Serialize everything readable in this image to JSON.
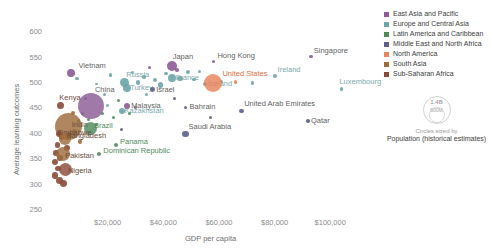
{
  "chart_data": {
    "type": "scatter",
    "title": "",
    "xlabel": "GDP per capita",
    "ylabel": "Average learning outcomes",
    "xlim": [
      0,
      115000
    ],
    "ylim": [
      250,
      620
    ],
    "xticks": [
      "$20,000",
      "$40,000",
      "$60,000",
      "$80,000",
      "$100,000"
    ],
    "xtick_values": [
      20000,
      40000,
      60000,
      80000,
      100000
    ],
    "yticks": [
      "250",
      "300",
      "350",
      "400",
      "450",
      "500",
      "550",
      "600"
    ],
    "ytick_values": [
      250,
      300,
      350,
      400,
      450,
      500,
      550,
      600
    ],
    "grid": false,
    "legend_position": "right",
    "size_encoding": "Population (historical estimates)",
    "points": [
      {
        "name": "Vietnam",
        "x": 7000,
        "y": 519,
        "r": 4.0,
        "region": "east_asia",
        "label_dx": 7,
        "label_dy": -8
      },
      {
        "name": "Japan",
        "x": 43000,
        "y": 533,
        "r": 5.0,
        "region": "east_asia",
        "label_dx": 1,
        "label_dy": -10
      },
      {
        "name": "Hong Kong",
        "x": 58000,
        "y": 542,
        "r": 1.8,
        "region": "east_asia",
        "label_dx": 4,
        "label_dy": -7
      },
      {
        "name": "Singapore",
        "x": 93000,
        "y": 552,
        "r": 1.8,
        "region": "east_asia",
        "label_dx": 3,
        "label_dy": -7
      },
      {
        "name": "Russia",
        "x": 26000,
        "y": 500,
        "r": 4.5,
        "region": "europe",
        "label_dx": 2,
        "label_dy": -9
      },
      {
        "name": "Turkey",
        "x": 27000,
        "y": 490,
        "r": 4.0,
        "region": "europe",
        "label_dx": 3,
        "label_dy": -1
      },
      {
        "name": "France",
        "x": 43000,
        "y": 510,
        "r": 4.0,
        "region": "europe",
        "label_dx": 4,
        "label_dy": -1
      },
      {
        "name": "Iceland",
        "x": 55000,
        "y": 497,
        "r": 2.0,
        "region": "europe",
        "label_dx": 3,
        "label_dy": -1
      },
      {
        "name": "Ireland",
        "x": 80000,
        "y": 513,
        "r": 2.0,
        "region": "europe",
        "label_dx": 3,
        "label_dy": -7
      },
      {
        "name": "Luxembourg",
        "x": 104000,
        "y": 488,
        "r": 1.6,
        "region": "europe",
        "label_dx": -2,
        "label_dy": -8
      },
      {
        "name": "Kazakhstan",
        "x": 25000,
        "y": 445,
        "r": 3.0,
        "region": "europe",
        "label_dx": 3,
        "label_dy": -1
      },
      {
        "name": "China",
        "x": 14000,
        "y": 455,
        "r": 13.0,
        "region": "east_asia",
        "label_dx": 0,
        "label_dy": -17
      },
      {
        "name": "Malaysia",
        "x": 27000,
        "y": 455,
        "r": 3.2,
        "region": "east_asia",
        "label_dx": 4,
        "label_dy": -1
      },
      {
        "name": "Kenya",
        "x": 3000,
        "y": 455,
        "r": 3.5,
        "region": "subsaharan",
        "label_dx": -1,
        "label_dy": -9
      },
      {
        "name": "India",
        "x": 6000,
        "y": 415,
        "r": 13.5,
        "region": "south_asia",
        "label_dx": 3,
        "label_dy": -2
      },
      {
        "name": "Brazil",
        "x": 14000,
        "y": 410,
        "r": 6.5,
        "region": "latin",
        "label_dx": 3,
        "label_dy": 0
      },
      {
        "name": "Zimbabwe",
        "x": 2500,
        "y": 400,
        "r": 3.0,
        "region": "subsaharan",
        "label_dx": -2,
        "label_dy": -2
      },
      {
        "name": "Bangladesh",
        "x": 4500,
        "y": 390,
        "r": 6.0,
        "region": "south_asia",
        "label_dx": 2,
        "label_dy": 0
      },
      {
        "name": "Pakistan",
        "x": 4000,
        "y": 360,
        "r": 7.0,
        "region": "south_asia",
        "label_dx": 2,
        "label_dy": 1
      },
      {
        "name": "Nigeria",
        "x": 5000,
        "y": 330,
        "r": 6.5,
        "region": "subsaharan",
        "label_dx": 2,
        "label_dy": 1
      },
      {
        "name": "Dominican Republic",
        "x": 17000,
        "y": 360,
        "r": 2.2,
        "region": "latin",
        "label_dx": 4,
        "label_dy": 0
      },
      {
        "name": "Panama",
        "x": 23000,
        "y": 378,
        "r": 2.0,
        "region": "latin",
        "label_dx": 4,
        "label_dy": 0
      },
      {
        "name": "Israel",
        "x": 36000,
        "y": 487,
        "r": 2.4,
        "region": "mena",
        "label_dx": 4,
        "label_dy": -1
      },
      {
        "name": "Bahrain",
        "x": 48000,
        "y": 452,
        "r": 1.8,
        "region": "mena",
        "label_dx": 4,
        "label_dy": -1
      },
      {
        "name": "Saudi Arabia",
        "x": 48000,
        "y": 400,
        "r": 3.2,
        "region": "mena",
        "label_dx": 3,
        "label_dy": -8
      },
      {
        "name": "United Arab Emirates",
        "x": 68000,
        "y": 445,
        "r": 2.4,
        "region": "mena",
        "label_dx": 3,
        "label_dy": -8
      },
      {
        "name": "Qatar",
        "x": 92000,
        "y": 425,
        "r": 1.8,
        "region": "mena",
        "label_dx": 3,
        "label_dy": -1
      },
      {
        "name": "United States",
        "x": 58000,
        "y": 500,
        "r": 9.0,
        "region": "north_america",
        "label_dx": 9,
        "label_dy": -10
      }
    ],
    "unlabeled_points": [
      {
        "x": 9000,
        "y": 508,
        "r": 1.6,
        "region": "europe"
      },
      {
        "x": 12000,
        "y": 470,
        "r": 1.6,
        "region": "latin"
      },
      {
        "x": 16000,
        "y": 498,
        "r": 1.4,
        "region": "europe"
      },
      {
        "x": 19000,
        "y": 478,
        "r": 1.6,
        "region": "europe"
      },
      {
        "x": 21000,
        "y": 516,
        "r": 1.8,
        "region": "europe"
      },
      {
        "x": 24000,
        "y": 466,
        "r": 1.6,
        "region": "latin"
      },
      {
        "x": 29000,
        "y": 521,
        "r": 1.6,
        "region": "europe"
      },
      {
        "x": 31000,
        "y": 501,
        "r": 2.2,
        "region": "europe"
      },
      {
        "x": 33000,
        "y": 512,
        "r": 1.8,
        "region": "europe"
      },
      {
        "x": 35000,
        "y": 530,
        "r": 1.6,
        "region": "east_asia"
      },
      {
        "x": 37000,
        "y": 506,
        "r": 2.0,
        "region": "europe"
      },
      {
        "x": 39000,
        "y": 496,
        "r": 2.6,
        "region": "europe"
      },
      {
        "x": 41000,
        "y": 519,
        "r": 1.6,
        "region": "europe"
      },
      {
        "x": 45000,
        "y": 525,
        "r": 1.8,
        "region": "east_asia"
      },
      {
        "x": 46000,
        "y": 509,
        "r": 2.6,
        "region": "europe"
      },
      {
        "x": 49000,
        "y": 521,
        "r": 2.0,
        "region": "europe"
      },
      {
        "x": 51000,
        "y": 507,
        "r": 1.6,
        "region": "europe"
      },
      {
        "x": 53000,
        "y": 523,
        "r": 1.6,
        "region": "europe"
      },
      {
        "x": 61000,
        "y": 503,
        "r": 1.6,
        "region": "europe"
      },
      {
        "x": 66000,
        "y": 502,
        "r": 1.6,
        "region": "north_america"
      },
      {
        "x": 72000,
        "y": 500,
        "r": 1.6,
        "region": "europe"
      },
      {
        "x": 57000,
        "y": 432,
        "r": 1.5,
        "region": "mena"
      },
      {
        "x": 30000,
        "y": 452,
        "r": 1.6,
        "region": "east_asia"
      },
      {
        "x": 28000,
        "y": 440,
        "r": 1.5,
        "region": "latin"
      },
      {
        "x": 22000,
        "y": 432,
        "r": 1.5,
        "region": "latin"
      },
      {
        "x": 18000,
        "y": 440,
        "r": 1.5,
        "region": "latin"
      },
      {
        "x": 20000,
        "y": 455,
        "r": 1.5,
        "region": "europe"
      },
      {
        "x": 11000,
        "y": 440,
        "r": 1.8,
        "region": "latin"
      },
      {
        "x": 9500,
        "y": 425,
        "r": 1.8,
        "region": "latin"
      },
      {
        "x": 13000,
        "y": 428,
        "r": 1.6,
        "region": "latin"
      },
      {
        "x": 16000,
        "y": 418,
        "r": 1.6,
        "region": "latin"
      },
      {
        "x": 8000,
        "y": 405,
        "r": 2.6,
        "region": "latin"
      },
      {
        "x": 6500,
        "y": 398,
        "r": 2.4,
        "region": "subsaharan"
      },
      {
        "x": 3500,
        "y": 392,
        "r": 2.6,
        "region": "subsaharan"
      },
      {
        "x": 2000,
        "y": 378,
        "r": 2.6,
        "region": "subsaharan"
      },
      {
        "x": 5500,
        "y": 372,
        "r": 3.0,
        "region": "subsaharan"
      },
      {
        "x": 1500,
        "y": 362,
        "r": 2.8,
        "region": "subsaharan"
      },
      {
        "x": 2800,
        "y": 352,
        "r": 3.2,
        "region": "subsaharan"
      },
      {
        "x": 1200,
        "y": 344,
        "r": 3.0,
        "region": "subsaharan"
      },
      {
        "x": 2200,
        "y": 332,
        "r": 2.8,
        "region": "subsaharan"
      },
      {
        "x": 1000,
        "y": 318,
        "r": 3.2,
        "region": "subsaharan"
      },
      {
        "x": 2600,
        "y": 308,
        "r": 3.6,
        "region": "subsaharan"
      },
      {
        "x": 4200,
        "y": 302,
        "r": 3.4,
        "region": "subsaharan"
      },
      {
        "x": 7500,
        "y": 440,
        "r": 2.0,
        "region": "south_asia"
      },
      {
        "x": 10000,
        "y": 385,
        "r": 2.2,
        "region": "south_asia"
      },
      {
        "x": 25000,
        "y": 408,
        "r": 1.5,
        "region": "mena"
      },
      {
        "x": 44000,
        "y": 470,
        "r": 1.5,
        "region": "mena"
      },
      {
        "x": 34000,
        "y": 478,
        "r": 1.5,
        "region": "europe"
      }
    ]
  },
  "legend": {
    "items": [
      {
        "label": "East Asia and Pacific",
        "color": "#8c5b96"
      },
      {
        "label": "Europe and Central Asia",
        "color": "#6aa5a8"
      },
      {
        "label": "Latin America and Caribbean",
        "color": "#4f8a5b"
      },
      {
        "label": "Middle East and North Africa",
        "color": "#5a5f8a"
      },
      {
        "label": "North America",
        "color": "#e8835a"
      },
      {
        "label": "South Asia",
        "color": "#9e6b3c"
      },
      {
        "label": "Sub-Saharan Africa",
        "color": "#8a4a38"
      }
    ],
    "size_legend": {
      "big_value": "1.4B",
      "small_value": "600M",
      "caption_line1": "Circles sized by",
      "caption_line2": "Population (historical estimates)"
    }
  }
}
